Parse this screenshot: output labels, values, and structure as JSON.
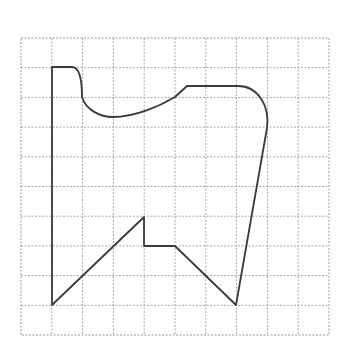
{
  "diagram": {
    "type": "grid-figure",
    "grid": {
      "columns": 10,
      "rows": 10,
      "origin_px": [
        21,
        38
      ],
      "cell_width_px": 30.8,
      "cell_height_px": 29.7,
      "line_color": "#a8a8a8",
      "line_style": "dashed"
    },
    "shape": {
      "stroke_color": "#3a3a3a",
      "closed": true,
      "description": "Irregular closed figure with straight segments and curved top edge drawn on a 10x10 square grid",
      "vertices_grid_units": [
        {
          "x": 1,
          "y": 1
        },
        {
          "x": 1.7,
          "y": 1
        },
        {
          "x": 2,
          "y": 2
        },
        {
          "x": 3,
          "y": 2.65
        },
        {
          "x": 5,
          "y": 2
        },
        {
          "x": 5.4,
          "y": 1.65
        },
        {
          "x": 7,
          "y": 1.65
        },
        {
          "x": 8,
          "y": 3
        },
        {
          "x": 7,
          "y": 9
        },
        {
          "x": 5,
          "y": 7
        },
        {
          "x": 4,
          "y": 7
        },
        {
          "x": 4,
          "y": 6
        },
        {
          "x": 1,
          "y": 9
        }
      ],
      "path_d": "M52,67 L72,67 C80,67 82,80 82,97 C86,110 100,117 113,117 C135,117 160,106 175,97 L187,86 L238,86 C258,86 270,106 267,128 L236,305 L175,246 L144,246 L144,217 L52,305 Z"
    }
  }
}
